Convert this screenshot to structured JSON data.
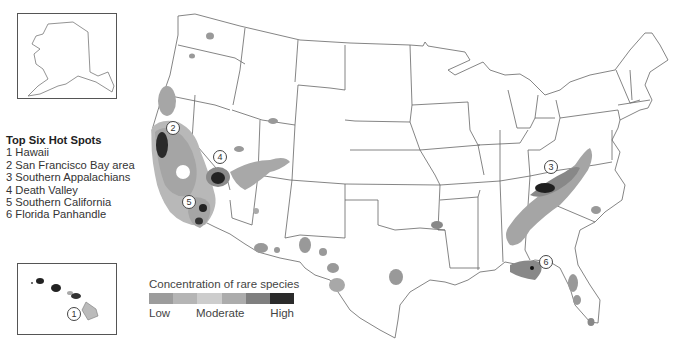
{
  "legend_hotspots": {
    "title": "Top Six Hot Spots",
    "items": [
      {
        "rank": "1",
        "label": "1 Hawaii"
      },
      {
        "rank": "2",
        "label": "2 San Francisco Bay area"
      },
      {
        "rank": "3",
        "label": "3 Southern Appalachians"
      },
      {
        "rank": "4",
        "label": "4 Death Valley"
      },
      {
        "rank": "5",
        "label": "5 Southern California"
      },
      {
        "rank": "6",
        "label": "6 Florida Panhandle"
      }
    ]
  },
  "legend_concentration": {
    "title": "Concentration of rare species",
    "low": "Low",
    "moderate": "Moderate",
    "high": "High",
    "swatches": [
      "#9c9c9c",
      "#b5b5b5",
      "#cdcdcd",
      "#acacac",
      "#7f7f7f",
      "#2b2b2b"
    ]
  },
  "markers": [
    {
      "id": "1",
      "label": "1",
      "x": 74,
      "y": 314
    },
    {
      "id": "2",
      "label": "2",
      "x": 173,
      "y": 128
    },
    {
      "id": "3",
      "label": "3",
      "x": 551,
      "y": 167
    },
    {
      "id": "4",
      "label": "4",
      "x": 220,
      "y": 157
    },
    {
      "id": "5",
      "label": "5",
      "x": 189,
      "y": 202
    },
    {
      "id": "6",
      "label": "6",
      "x": 546,
      "y": 262
    }
  ],
  "insets": {
    "alaska": "Alaska",
    "hawaii": "Hawaii"
  },
  "colors": {
    "state_line": "#555555",
    "high": "#222222",
    "mid_dark": "#7a7a7a",
    "mid": "#a8a8a8",
    "light": "#c8c8c8"
  }
}
